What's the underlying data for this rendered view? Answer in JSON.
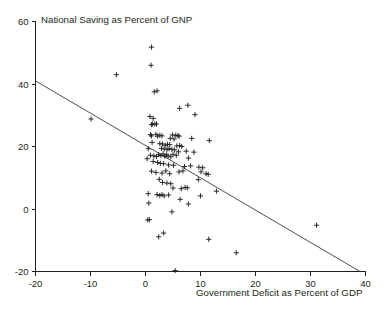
{
  "chart_data": {
    "type": "scatter",
    "title": "",
    "xlabel": "Government Deficit as Percent of GDP",
    "ylabel": "National Saving as Percent of GNP",
    "xlim": [
      -20,
      40
    ],
    "ylim": [
      -20,
      60
    ],
    "xticks": [
      -20,
      -10,
      0,
      10,
      20,
      30,
      40
    ],
    "xtick_labels": [
      "-20",
      "-10",
      "0",
      "10",
      "20",
      "30",
      "40"
    ],
    "yticks": [
      -20,
      0,
      20,
      40,
      60
    ],
    "ytick_labels": [
      "-20",
      "0",
      "20",
      "40",
      "60"
    ],
    "grid": false,
    "legend": false,
    "marker": "plus",
    "marker_color": "#231f20",
    "line_color": "#3a3a3a",
    "trendline": {
      "name": "regression-line",
      "x": [
        -20,
        39
      ],
      "y": [
        41,
        -20
      ],
      "slope": -1.034,
      "intercept": 20.3
    },
    "points": [
      [
        1.1,
        51.8
      ],
      [
        1.0,
        46.0
      ],
      [
        -5.3,
        43.0
      ],
      [
        1.6,
        37.5
      ],
      [
        2.1,
        37.8
      ],
      [
        -9.9,
        28.8
      ],
      [
        6.2,
        32.2
      ],
      [
        7.7,
        33.2
      ],
      [
        9.0,
        30.2
      ],
      [
        0.8,
        29.6
      ],
      [
        1.4,
        29.0
      ],
      [
        1.3,
        27.2
      ],
      [
        1.7,
        27.2
      ],
      [
        1.1,
        27.0
      ],
      [
        2.0,
        27.2
      ],
      [
        0.9,
        23.8
      ],
      [
        1.1,
        23.4
      ],
      [
        1.9,
        23.9
      ],
      [
        2.2,
        23.3
      ],
      [
        2.6,
        23.6
      ],
      [
        3.0,
        23.4
      ],
      [
        4.9,
        23.7
      ],
      [
        5.5,
        23.6
      ],
      [
        5.9,
        23.5
      ],
      [
        6.1,
        23.3
      ],
      [
        4.5,
        22.6
      ],
      [
        5.2,
        22.4
      ],
      [
        8.4,
        22.6
      ],
      [
        11.6,
        21.9
      ],
      [
        0.5,
        19.3
      ],
      [
        1.2,
        21.3
      ],
      [
        2.6,
        20.9
      ],
      [
        3.1,
        20.8
      ],
      [
        3.6,
        20.4
      ],
      [
        4.0,
        20.7
      ],
      [
        4.4,
        20.6
      ],
      [
        5.7,
        20.2
      ],
      [
        6.2,
        20.3
      ],
      [
        6.6,
        20.0
      ],
      [
        2.9,
        19.4
      ],
      [
        3.4,
        19.2
      ],
      [
        3.9,
        19.0
      ],
      [
        4.3,
        19.3
      ],
      [
        4.8,
        19.1
      ],
      [
        5.3,
        18.9
      ],
      [
        6.0,
        18.3
      ],
      [
        7.4,
        18.5
      ],
      [
        8.8,
        18.2
      ],
      [
        0.3,
        16.1
      ],
      [
        0.9,
        17.2
      ],
      [
        1.5,
        17.0
      ],
      [
        2.0,
        16.8
      ],
      [
        2.4,
        17.4
      ],
      [
        2.8,
        17.1
      ],
      [
        3.2,
        17.6
      ],
      [
        3.5,
        16.9
      ],
      [
        3.8,
        17.3
      ],
      [
        4.1,
        17.0
      ],
      [
        4.6,
        16.7
      ],
      [
        5.0,
        17.5
      ],
      [
        5.6,
        17.2
      ],
      [
        7.8,
        16.3
      ],
      [
        1.4,
        15.2
      ],
      [
        2.2,
        14.9
      ],
      [
        2.7,
        14.6
      ],
      [
        3.3,
        14.5
      ],
      [
        4.2,
        14.1
      ],
      [
        5.1,
        14.0
      ],
      [
        7.1,
        13.6
      ],
      [
        8.2,
        13.8
      ],
      [
        9.7,
        13.4
      ],
      [
        10.4,
        13.2
      ],
      [
        1.1,
        12.1
      ],
      [
        1.9,
        11.7
      ],
      [
        3.0,
        11.5
      ],
      [
        3.7,
        12.2
      ],
      [
        4.4,
        11.3
      ],
      [
        6.1,
        11.9
      ],
      [
        6.8,
        12.2
      ],
      [
        10.1,
        11.9
      ],
      [
        11.0,
        11.3
      ],
      [
        11.4,
        11.1
      ],
      [
        9.6,
        9.4
      ],
      [
        2.5,
        9.5
      ],
      [
        3.1,
        8.5
      ],
      [
        3.9,
        8.3
      ],
      [
        4.6,
        8.1
      ],
      [
        5.0,
        6.7
      ],
      [
        6.5,
        6.5
      ],
      [
        7.2,
        6.9
      ],
      [
        7.6,
        6.8
      ],
      [
        12.9,
        5.7
      ],
      [
        0.5,
        4.9
      ],
      [
        2.1,
        4.6
      ],
      [
        2.6,
        4.3
      ],
      [
        3.0,
        4.6
      ],
      [
        3.4,
        4.2
      ],
      [
        4.2,
        4.5
      ],
      [
        6.3,
        3.1
      ],
      [
        10.0,
        4.2
      ],
      [
        7.8,
        1.6
      ],
      [
        0.6,
        1.9
      ],
      [
        4.8,
        -0.9
      ],
      [
        0.4,
        -3.5
      ],
      [
        0.7,
        -3.4
      ],
      [
        2.4,
        -8.9
      ],
      [
        3.3,
        -7.7
      ],
      [
        11.5,
        -9.7
      ],
      [
        16.5,
        -14.0
      ],
      [
        31.1,
        -5.2
      ],
      [
        5.4,
        -19.7
      ]
    ]
  }
}
